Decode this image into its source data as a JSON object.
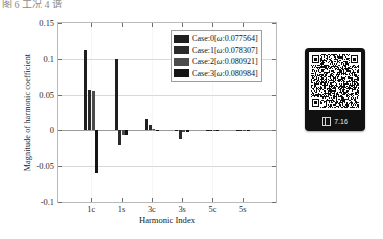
{
  "caption_fragment": "图 6 工况 4 谐",
  "chart_data": {
    "type": "bar",
    "title": "",
    "xlabel": "Harmonic Index",
    "ylabel": "Magnitude of harmonic coefficient",
    "categories": [
      "1c",
      "1s",
      "3c",
      "3s",
      "5c",
      "5s"
    ],
    "ylim": [
      -0.1,
      0.15
    ],
    "yticks": [
      0.15,
      0.1,
      0.05,
      0,
      -0.05,
      -0.1
    ],
    "ytick_labels": [
      "0.15",
      "0.1",
      "0.05",
      "0",
      "-0.05",
      "-0.1"
    ],
    "grid": false,
    "legend_position": "upper-right",
    "series": [
      {
        "name": "Case:0",
        "omega": "0.077564",
        "legend_label": "Case:0[ω:0.077564]",
        "color": "#1e1e1e",
        "values": [
          0.112,
          0.1,
          0.016,
          -0.0015,
          -0.0012,
          -0.001
        ]
      },
      {
        "name": "Case:1",
        "omega": "0.078307",
        "legend_label": "Case:1[ω:0.078307]",
        "color": "#2a2a2a",
        "values": [
          0.056,
          -0.02,
          0.008,
          -0.012,
          -0.0014,
          -0.0011
        ]
      },
      {
        "name": "Case:2",
        "omega": "0.080921",
        "legend_label": "Case:2[ω:0.080921]",
        "color": "#4b4b4b",
        "values": [
          0.055,
          -0.0065,
          0.002,
          -0.002,
          -0.0009,
          -0.0008
        ]
      },
      {
        "name": "Case:3",
        "omega": "0.080984",
        "legend_label": "Case:3[ω:0.080984]",
        "color": "#141414",
        "values": [
          -0.06,
          -0.006,
          0.0012,
          -0.0016,
          -0.0008,
          -0.0007
        ]
      }
    ]
  },
  "qr_panel": {
    "footer_label": "7.16",
    "footer_icon": "scan-icon"
  }
}
